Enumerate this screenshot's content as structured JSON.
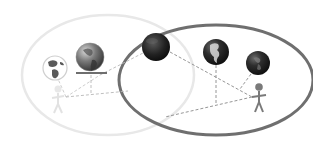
{
  "diagram": {
    "colors": {
      "background": "#ffffff",
      "faint_ellipse": "#e6e6e6",
      "bold_ellipse": "#707070",
      "faint_person": "#e4e4e4",
      "bold_person": "#7a7a7a",
      "dashed_line": "#808080",
      "platform": "#6e6e6e",
      "globe_dark": "#2a2a2a",
      "globe_mid": "#555555",
      "globe_light": "#9a9a9a"
    },
    "groups": [
      {
        "id": "left",
        "emphasis": "faded",
        "person": "faded-person",
        "globes": [
          "small-globe-outlined",
          "globe-on-platform"
        ]
      },
      {
        "id": "right",
        "emphasis": "strong",
        "person": "person",
        "globes": [
          "globe-americas",
          "small-dark-globe"
        ]
      }
    ],
    "shared_globe": "dark-globe-on-boundary"
  }
}
